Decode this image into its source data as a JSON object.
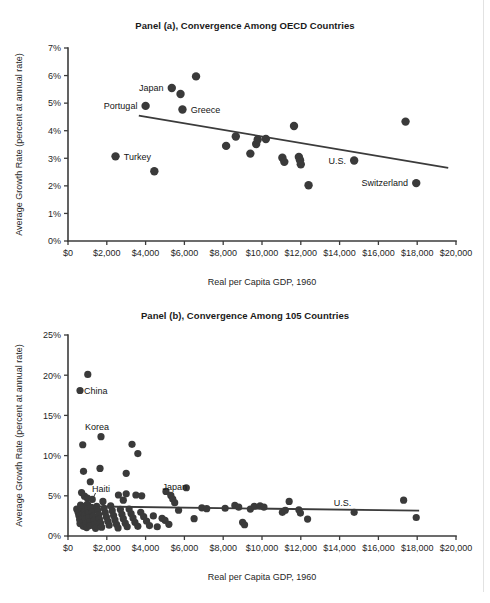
{
  "figure": {
    "background_color": "#ffffff",
    "page_edge_color": "#d8d8d8",
    "ink_color": "#3a3a3a"
  },
  "chart_data": [
    {
      "type": "scatter",
      "panel_id": "a",
      "title": "Panel (a), Convergence Among OECD Countries",
      "xlabel": "Real per Capita GDP, 1960",
      "ylabel": "Average Growth Rate (percent at annual rate)",
      "xlim": [
        0,
        20000
      ],
      "ylim": [
        0,
        7
      ],
      "grid": false,
      "legend": "none",
      "xticks": [
        0,
        2000,
        4000,
        6000,
        8000,
        10000,
        12000,
        14000,
        16000,
        18000,
        20000
      ],
      "xticklabels": [
        "$0",
        "$2,000",
        "$4,000",
        "$6,000",
        "$8,000",
        "$10,000",
        "$12,000",
        "$14,000",
        "$16,000",
        "$18,000",
        "$20,000"
      ],
      "yticks": [
        0,
        1,
        2,
        3,
        4,
        5,
        6,
        7
      ],
      "yticklabels": [
        "0%",
        "1%",
        "2%",
        "3%",
        "4%",
        "5%",
        "6%",
        "7%"
      ],
      "points": [
        {
          "x": 2450,
          "y": 3.07,
          "label": "Turkey",
          "label_pos": "right"
        },
        {
          "x": 4000,
          "y": 4.9,
          "label": "Portugal",
          "label_pos": "left"
        },
        {
          "x": 4450,
          "y": 2.53,
          "label": "",
          "label_pos": ""
        },
        {
          "x": 5350,
          "y": 5.55,
          "label": "Japan",
          "label_pos": "left"
        },
        {
          "x": 5800,
          "y": 5.33,
          "label": "",
          "label_pos": ""
        },
        {
          "x": 5900,
          "y": 4.77,
          "label": "Greece",
          "label_pos": "right"
        },
        {
          "x": 6600,
          "y": 5.97,
          "label": "",
          "label_pos": ""
        },
        {
          "x": 8150,
          "y": 3.45,
          "label": "",
          "label_pos": ""
        },
        {
          "x": 8650,
          "y": 3.79,
          "label": "",
          "label_pos": ""
        },
        {
          "x": 9400,
          "y": 3.17,
          "label": "",
          "label_pos": ""
        },
        {
          "x": 9700,
          "y": 3.52,
          "label": "",
          "label_pos": ""
        },
        {
          "x": 9780,
          "y": 3.68,
          "label": "",
          "label_pos": ""
        },
        {
          "x": 10200,
          "y": 3.7,
          "label": "",
          "label_pos": ""
        },
        {
          "x": 11050,
          "y": 3.02,
          "label": "",
          "label_pos": ""
        },
        {
          "x": 11150,
          "y": 2.87,
          "label": "",
          "label_pos": ""
        },
        {
          "x": 11650,
          "y": 4.17,
          "label": "",
          "label_pos": ""
        },
        {
          "x": 11900,
          "y": 3.05,
          "label": "",
          "label_pos": ""
        },
        {
          "x": 11960,
          "y": 2.93,
          "label": "",
          "label_pos": ""
        },
        {
          "x": 12000,
          "y": 2.78,
          "label": "",
          "label_pos": ""
        },
        {
          "x": 12400,
          "y": 2.02,
          "label": "",
          "label_pos": ""
        },
        {
          "x": 14750,
          "y": 2.92,
          "label": "U.S.",
          "label_pos": "left"
        },
        {
          "x": 17400,
          "y": 4.33,
          "label": "",
          "label_pos": ""
        },
        {
          "x": 17950,
          "y": 2.1,
          "label": "Switzerland",
          "label_pos": "left"
        }
      ],
      "fitline": {
        "x0": 3650,
        "y0": 4.55,
        "x1": 19600,
        "y1": 2.65
      }
    },
    {
      "type": "scatter",
      "panel_id": "b",
      "title": "Panel (b), Convergence Among 105 Countries",
      "xlabel": "Real per Capita GDP, 1960",
      "ylabel": "Average Growth Rate (percent at annual rate)",
      "xlim": [
        0,
        20000
      ],
      "ylim": [
        0,
        25
      ],
      "grid": false,
      "legend": "none",
      "xticks": [
        0,
        2000,
        4000,
        6000,
        8000,
        10000,
        12000,
        14000,
        16000,
        18000,
        20000
      ],
      "xticklabels": [
        "$0",
        "$2,000",
        "$4,000",
        "$6,000",
        "$8,000",
        "$10,000",
        "$12,000",
        "$14,000",
        "$16,000",
        "$18,000",
        "$20,000"
      ],
      "yticks": [
        0,
        5,
        10,
        15,
        20,
        25
      ],
      "yticklabels": [
        "0%",
        "5%",
        "10%",
        "15%",
        "20%",
        "25%"
      ],
      "annotations": [
        {
          "text": "China",
          "x": 830,
          "y": 18.1,
          "pos": "right"
        },
        {
          "text": "Korea",
          "x": 1500,
          "y": 13.6,
          "pos": "center"
        },
        {
          "text": "Haiti",
          "x": 1700,
          "y": 5.85,
          "pos": "center"
        },
        {
          "text": "Japan",
          "x": 5500,
          "y": 6.1,
          "pos": "center"
        },
        {
          "text": "U.S.",
          "x": 14150,
          "y": 4.15,
          "pos": "center"
        }
      ],
      "leader": {
        "x0": 1420,
        "y0": 5.35,
        "x1": 820,
        "y1": 2.35
      },
      "points": [
        {
          "x": 620,
          "y": 18.1
        },
        {
          "x": 1020,
          "y": 20.1
        },
        {
          "x": 760,
          "y": 11.35
        },
        {
          "x": 1700,
          "y": 12.35
        },
        {
          "x": 3300,
          "y": 11.4
        },
        {
          "x": 3600,
          "y": 10.25
        },
        {
          "x": 800,
          "y": 8.05
        },
        {
          "x": 1650,
          "y": 8.4
        },
        {
          "x": 3000,
          "y": 7.8
        },
        {
          "x": 1150,
          "y": 6.75
        },
        {
          "x": 6100,
          "y": 6.0
        },
        {
          "x": 700,
          "y": 5.4
        },
        {
          "x": 850,
          "y": 4.95
        },
        {
          "x": 1000,
          "y": 4.7
        },
        {
          "x": 1250,
          "y": 4.55
        },
        {
          "x": 2600,
          "y": 5.1
        },
        {
          "x": 2850,
          "y": 4.45
        },
        {
          "x": 3000,
          "y": 5.25
        },
        {
          "x": 3500,
          "y": 5.1
        },
        {
          "x": 3800,
          "y": 5.0
        },
        {
          "x": 5050,
          "y": 5.55
        },
        {
          "x": 5300,
          "y": 5.05
        },
        {
          "x": 5400,
          "y": 4.6
        },
        {
          "x": 5500,
          "y": 4.15
        },
        {
          "x": 17300,
          "y": 4.45
        },
        {
          "x": 11400,
          "y": 4.3
        },
        {
          "x": 450,
          "y": 3.35
        },
        {
          "x": 520,
          "y": 2.95
        },
        {
          "x": 560,
          "y": 2.55
        },
        {
          "x": 600,
          "y": 2.05
        },
        {
          "x": 620,
          "y": 1.55
        },
        {
          "x": 650,
          "y": 3.85
        },
        {
          "x": 700,
          "y": 3.25
        },
        {
          "x": 720,
          "y": 2.7
        },
        {
          "x": 740,
          "y": 2.2
        },
        {
          "x": 760,
          "y": 1.7
        },
        {
          "x": 790,
          "y": 1.2
        },
        {
          "x": 820,
          "y": 3.65
        },
        {
          "x": 850,
          "y": 3.1
        },
        {
          "x": 880,
          "y": 2.6
        },
        {
          "x": 900,
          "y": 2.1
        },
        {
          "x": 930,
          "y": 1.55
        },
        {
          "x": 960,
          "y": 1.05
        },
        {
          "x": 990,
          "y": 3.95
        },
        {
          "x": 1020,
          "y": 3.4
        },
        {
          "x": 1060,
          "y": 2.85
        },
        {
          "x": 1090,
          "y": 2.3
        },
        {
          "x": 1120,
          "y": 1.8
        },
        {
          "x": 1150,
          "y": 1.3
        },
        {
          "x": 1200,
          "y": 3.55
        },
        {
          "x": 1250,
          "y": 3.05
        },
        {
          "x": 1300,
          "y": 2.45
        },
        {
          "x": 1340,
          "y": 1.95
        },
        {
          "x": 1380,
          "y": 1.45
        },
        {
          "x": 1420,
          "y": 0.95
        },
        {
          "x": 1480,
          "y": 3.7
        },
        {
          "x": 1530,
          "y": 3.2
        },
        {
          "x": 1580,
          "y": 2.65
        },
        {
          "x": 1620,
          "y": 2.1
        },
        {
          "x": 1680,
          "y": 1.6
        },
        {
          "x": 1730,
          "y": 1.1
        },
        {
          "x": 1800,
          "y": 4.3
        },
        {
          "x": 1860,
          "y": 3.45
        },
        {
          "x": 1920,
          "y": 2.9
        },
        {
          "x": 1980,
          "y": 2.35
        },
        {
          "x": 2050,
          "y": 1.85
        },
        {
          "x": 2120,
          "y": 1.35
        },
        {
          "x": 2200,
          "y": 3.75
        },
        {
          "x": 2280,
          "y": 3.15
        },
        {
          "x": 2350,
          "y": 2.55
        },
        {
          "x": 2420,
          "y": 2.0
        },
        {
          "x": 2500,
          "y": 1.45
        },
        {
          "x": 2580,
          "y": 1.0
        },
        {
          "x": 2700,
          "y": 3.3
        },
        {
          "x": 2780,
          "y": 2.7
        },
        {
          "x": 2850,
          "y": 2.15
        },
        {
          "x": 2950,
          "y": 1.6
        },
        {
          "x": 3050,
          "y": 1.15
        },
        {
          "x": 3150,
          "y": 3.35
        },
        {
          "x": 3250,
          "y": 2.8
        },
        {
          "x": 3350,
          "y": 2.25
        },
        {
          "x": 3450,
          "y": 1.7
        },
        {
          "x": 3600,
          "y": 1.2
        },
        {
          "x": 3750,
          "y": 2.95
        },
        {
          "x": 3900,
          "y": 2.4
        },
        {
          "x": 4050,
          "y": 1.85
        },
        {
          "x": 4200,
          "y": 1.3
        },
        {
          "x": 4400,
          "y": 2.5
        },
        {
          "x": 4600,
          "y": 1.15
        },
        {
          "x": 4850,
          "y": 2.2
        },
        {
          "x": 5000,
          "y": 1.95
        },
        {
          "x": 5200,
          "y": 1.45
        },
        {
          "x": 5700,
          "y": 3.2
        },
        {
          "x": 6500,
          "y": 2.15
        },
        {
          "x": 6900,
          "y": 3.5
        },
        {
          "x": 7150,
          "y": 3.4
        },
        {
          "x": 8100,
          "y": 3.45
        },
        {
          "x": 8600,
          "y": 3.8
        },
        {
          "x": 8800,
          "y": 3.6
        },
        {
          "x": 9000,
          "y": 1.7
        },
        {
          "x": 9100,
          "y": 1.4
        },
        {
          "x": 9400,
          "y": 3.35
        },
        {
          "x": 9600,
          "y": 3.7
        },
        {
          "x": 9900,
          "y": 3.75
        },
        {
          "x": 10100,
          "y": 3.6
        },
        {
          "x": 11050,
          "y": 2.95
        },
        {
          "x": 11200,
          "y": 3.2
        },
        {
          "x": 11900,
          "y": 3.25
        },
        {
          "x": 11980,
          "y": 2.85
        },
        {
          "x": 12350,
          "y": 2.1
        },
        {
          "x": 14750,
          "y": 2.95
        },
        {
          "x": 17950,
          "y": 2.3
        }
      ],
      "fitline": {
        "x0": 760,
        "y0": 3.7,
        "x1": 18100,
        "y1": 3.15
      }
    }
  ]
}
